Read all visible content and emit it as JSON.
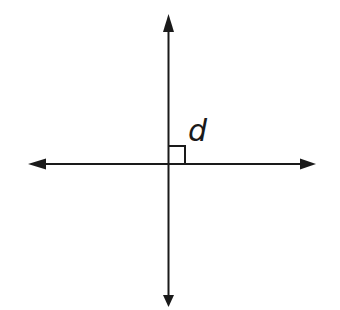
{
  "diagram": {
    "colors": {
      "line": "#1a1a1a",
      "background": "#ffffff"
    },
    "intersection": {
      "x": 168.5,
      "y": 164
    },
    "vertical_line": {
      "x": 168.5,
      "y_top_tip": 14,
      "y_bottom_tip": 307
    },
    "horizontal_line": {
      "y": 164,
      "x_left_tip": 28,
      "x_right_tip": 316
    },
    "right_angle_marker": {
      "size": 17,
      "quadrant": "upper-right"
    },
    "label": {
      "text": "d",
      "x": 188,
      "y": 141
    }
  }
}
